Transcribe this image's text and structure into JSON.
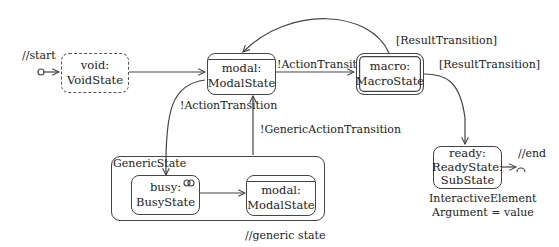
{
  "diagram": {
    "type": "state-machine",
    "annotations": {
      "start": "//start",
      "end": "//end",
      "generic_state_note": "//generic state"
    },
    "states": {
      "void": {
        "name": "void:",
        "type": "VoidState",
        "style": "dashed"
      },
      "modal": {
        "name": "modal:",
        "type": "ModalState",
        "style": "modal-topbar"
      },
      "macro": {
        "name": "macro:",
        "type": "MacroState",
        "style": "double-border"
      },
      "ready": {
        "name": "ready:",
        "type": "ReadyState:",
        "subtype": "SubState",
        "style": "rounded"
      },
      "busy": {
        "name": "busy:",
        "type": "BusyState",
        "icon": "infinity-icon"
      },
      "inner_modal": {
        "name": "modal:",
        "type": "ModalState",
        "style": "modal-topbar"
      }
    },
    "container": {
      "label": "GenericState"
    },
    "ready_note": {
      "line1": "InteractiveElement",
      "line2": "Argument =  value"
    },
    "transitions": {
      "modal_to_macro": "!ActionTransition",
      "macro_to_modal": "[ResultTransition]",
      "macro_to_ready": "[ResultTransition]",
      "modal_to_busy": "!ActionTransition",
      "generic_to_modal": "!GenericActionTransition"
    },
    "colors": {
      "line": "#444444",
      "text": "#222222",
      "background": "#ffffff"
    }
  }
}
